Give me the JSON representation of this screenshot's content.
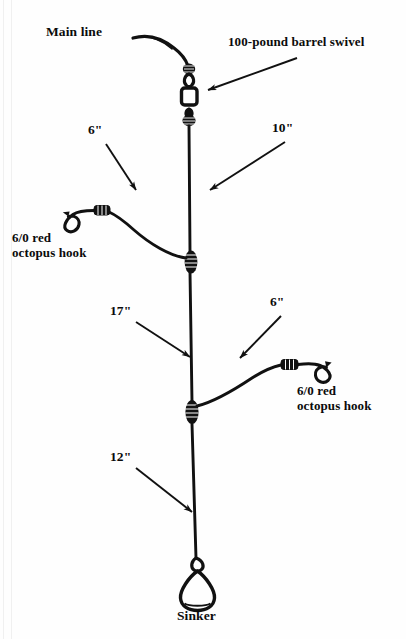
{
  "diagram": {
    "background_color": "#fefefe",
    "ink_color": "#111111",
    "width": 406,
    "height": 639
  },
  "labels": {
    "main_line": "Main line",
    "barrel_swivel": "100-pound barrel swivel",
    "hook_left": "6/0 red\noctopus hook",
    "hook_left_line1": "6/0 red",
    "hook_left_line2": "octopus hook",
    "hook_right_line1": "6/0 red",
    "hook_right_line2": "octopus hook",
    "sinker": "Sinker"
  },
  "measurements": {
    "swivel_to_first_dropper": "10\"",
    "upper_leader": "6\"",
    "between_droppers": "17\"",
    "lower_leader": "6\"",
    "dropper_to_sinker": "12\""
  },
  "components": [
    {
      "name": "main-line",
      "type": "line",
      "label": "Main line"
    },
    {
      "name": "barrel-swivel",
      "type": "swivel",
      "label": "100-pound barrel swivel",
      "rating": "100-pound"
    },
    {
      "name": "upper-dropper-knot",
      "type": "dropper-loop-knot",
      "wraps": 4
    },
    {
      "name": "upper-leader",
      "type": "leader",
      "length": "6\""
    },
    {
      "name": "upper-hook",
      "type": "octopus-hook",
      "size": "6/0",
      "color": "red"
    },
    {
      "name": "lower-dropper-knot",
      "type": "dropper-loop-knot",
      "wraps": 4
    },
    {
      "name": "lower-leader",
      "type": "leader",
      "length": "6\""
    },
    {
      "name": "lower-hook",
      "type": "octopus-hook",
      "size": "6/0",
      "color": "red"
    },
    {
      "name": "sinker",
      "type": "teardrop-sinker",
      "label": "Sinker"
    }
  ],
  "arrows": [
    {
      "name": "arrow-to-swivel",
      "from": "100-pound barrel swivel",
      "to": "barrel-swivel"
    },
    {
      "name": "arrow-6-upper",
      "from": "6\"",
      "to": "upper-leader"
    },
    {
      "name": "arrow-10",
      "from": "10\"",
      "to": "main-stem-upper"
    },
    {
      "name": "arrow-17",
      "from": "17\"",
      "to": "main-stem-middle"
    },
    {
      "name": "arrow-6-lower",
      "from": "6\"",
      "to": "lower-leader"
    },
    {
      "name": "arrow-12",
      "from": "12\"",
      "to": "main-stem-lower"
    }
  ]
}
